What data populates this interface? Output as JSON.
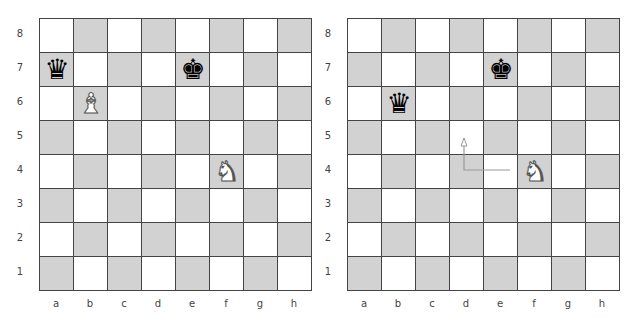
{
  "files": [
    "a",
    "b",
    "c",
    "d",
    "e",
    "f",
    "g",
    "h"
  ],
  "ranks": [
    "8",
    "7",
    "6",
    "5",
    "4",
    "3",
    "2",
    "1"
  ],
  "colors": {
    "light_square": "#ffffff",
    "dark_square": "#d2d2d2",
    "grid_line": "#444444",
    "arrow": "#999999"
  },
  "boards": [
    {
      "id": "left",
      "left": 39,
      "top": 18,
      "square": 34,
      "pieces": [
        {
          "square": "a7",
          "color": "black",
          "type": "queen",
          "glyph": "♛"
        },
        {
          "square": "e7",
          "color": "black",
          "type": "king",
          "glyph": "♚"
        },
        {
          "square": "b6",
          "color": "white",
          "type": "bishop",
          "glyph": "♝"
        },
        {
          "square": "f4",
          "color": "white",
          "type": "knight",
          "glyph": "♞"
        }
      ],
      "arrows": []
    },
    {
      "id": "right",
      "left": 347,
      "top": 18,
      "square": 34,
      "pieces": [
        {
          "square": "e7",
          "color": "black",
          "type": "king",
          "glyph": "♚"
        },
        {
          "square": "b6",
          "color": "black",
          "type": "queen",
          "glyph": "♛"
        },
        {
          "square": "f4",
          "color": "white",
          "type": "knight",
          "glyph": "♞"
        }
      ],
      "arrows": [
        {
          "description": "knight move path f4 to d5",
          "points": [
            [
              510,
              170
            ],
            [
              464,
              170
            ],
            [
              464,
              138
            ]
          ]
        }
      ]
    }
  ]
}
